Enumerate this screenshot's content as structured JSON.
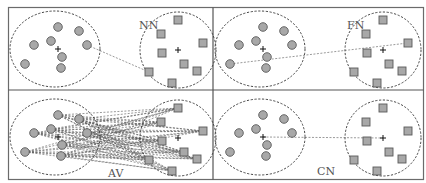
{
  "figure": {
    "colors": {
      "frame": "#6b6b6b",
      "point_fill": "#a8a8a8",
      "point_stroke": "#5a5a5a",
      "outline": "#333333",
      "label": "#555555"
    }
  },
  "panels": [
    {
      "id": "nn",
      "label": "NN",
      "meaning": "nearest neighbour (single linkage)",
      "offset": [
        0,
        0
      ],
      "label_pos": [
        139,
        29
      ],
      "link_type": "nearest",
      "links": [
        [
          [
            87,
            45
          ],
          [
            149,
            72
          ]
        ]
      ]
    },
    {
      "id": "fn",
      "label": "FN",
      "meaning": "furthest neighbour (complete linkage)",
      "offset": [
        205,
        0
      ],
      "label_pos": [
        347,
        29
      ],
      "link_type": "furthest",
      "links": [
        [
          [
            230,
            64
          ],
          [
            408,
            43
          ]
        ]
      ]
    },
    {
      "id": "av",
      "label": "AV",
      "meaning": "average linkage (all pairs)",
      "offset": [
        0,
        88
      ],
      "label_pos": [
        108,
        177
      ],
      "link_type": "all-pairs",
      "links": []
    },
    {
      "id": "cn",
      "label": "CN",
      "meaning": "centroid linkage",
      "offset": [
        205,
        88
      ],
      "label_pos": [
        317,
        175
      ],
      "link_type": "centroid",
      "links": [
        [
          [
            263,
            137
          ],
          [
            383,
            138
          ]
        ]
      ]
    }
  ],
  "clusters": {
    "circles": {
      "shape": "circle",
      "ellipse": {
        "cx": 55,
        "cy": 49,
        "rx": 45,
        "ry": 38
      },
      "centroid": [
        58,
        49
      ],
      "points": [
        [
          58,
          27
        ],
        [
          79,
          31
        ],
        [
          51,
          41
        ],
        [
          34,
          45
        ],
        [
          87,
          45
        ],
        [
          62,
          57
        ],
        [
          61,
          68
        ],
        [
          25,
          64
        ]
      ]
    },
    "squares": {
      "shape": "square",
      "ellipse": {
        "cx": 178,
        "cy": 50,
        "rx": 38,
        "ry": 38
      },
      "centroid": [
        178,
        50
      ],
      "points": [
        [
          178,
          20
        ],
        [
          161,
          34
        ],
        [
          203,
          43
        ],
        [
          162,
          53
        ],
        [
          184,
          64
        ],
        [
          197,
          71
        ],
        [
          149,
          72
        ],
        [
          172,
          83
        ]
      ]
    }
  }
}
